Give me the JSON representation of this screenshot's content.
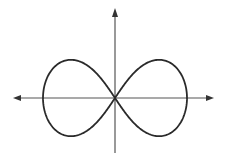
{
  "diagram": {
    "curve": "lemniscate",
    "colors": {
      "axes": "#555555",
      "curve": "#2a2a2a",
      "background": "#ffffff"
    },
    "geometry": {
      "origin": [
        115,
        98
      ],
      "half_width": 72,
      "x_axis": {
        "from": 13,
        "to": 214
      },
      "y_axis": {
        "from": 8,
        "to": 153
      }
    }
  }
}
